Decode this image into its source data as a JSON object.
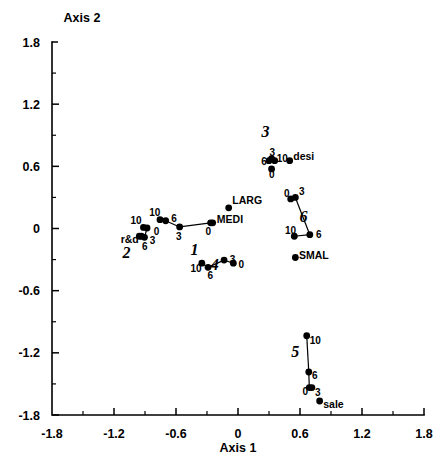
{
  "chart_data": {
    "type": "scatter",
    "title": "",
    "xlabel": "Axis 1",
    "ylabel": "Axis 2",
    "xlim": [
      -1.8,
      1.8
    ],
    "ylim": [
      -1.8,
      1.8
    ],
    "xticks": [
      "-1.8",
      "-1.2",
      "-0.6",
      "0",
      "0.6",
      "1.2",
      "1.8"
    ],
    "xtickvals": [
      -1.8,
      -1.2,
      -0.6,
      0,
      0.6,
      1.2,
      1.8
    ],
    "yticks": [
      "1.8",
      "1.2",
      "0.6",
      "0",
      "-0.6",
      "-1.2",
      "-1.8"
    ],
    "ytickvals": [
      1.8,
      1.2,
      0.6,
      0,
      -0.6,
      -1.2,
      -1.8
    ],
    "grid": false,
    "legend": "none",
    "series": [
      {
        "name": "1",
        "cluster_label": "1",
        "cluster_label_pos": [
          -0.42,
          -0.255
        ],
        "connected": true,
        "points": [
          {
            "label": "10",
            "x": -0.755,
            "y": 0.085,
            "lx": -0.86,
            "ly": 0.155
          },
          {
            "label": "6",
            "x": -0.7,
            "y": 0.075,
            "lx": -0.645,
            "ly": 0.1
          },
          {
            "label": "3",
            "x": -0.565,
            "y": 0.015,
            "lx": -0.6,
            "ly": -0.075
          },
          {
            "label": "0",
            "x": -0.265,
            "y": 0.055,
            "lx": -0.315,
            "ly": -0.03
          }
        ]
      },
      {
        "name": "2",
        "cluster_label": "2",
        "cluster_label_pos": [
          -1.08,
          -0.285
        ],
        "connected": true,
        "points": [
          {
            "label": "10",
            "x": -0.915,
            "y": 0.01,
            "lx": -1.04,
            "ly": 0.075
          },
          {
            "label": "0",
            "x": -0.88,
            "y": 0.005,
            "lx": -0.815,
            "ly": -0.025
          },
          {
            "label": "3",
            "x": -0.905,
            "y": -0.085,
            "lx": -0.855,
            "ly": -0.115
          },
          {
            "label": "6",
            "x": -0.935,
            "y": -0.075,
            "lx": -0.93,
            "ly": -0.175
          },
          {
            "label": "r&d",
            "x": -0.955,
            "y": -0.075,
            "lx": -1.135,
            "ly": -0.11,
            "is_var": true
          }
        ]
      },
      {
        "name": "3",
        "cluster_label": "3",
        "cluster_label_pos": [
          0.265,
          0.885
        ],
        "connected": true,
        "points": [
          {
            "label": "6",
            "x": 0.3,
            "y": 0.655,
            "lx": 0.225,
            "ly": 0.645
          },
          {
            "label": "3",
            "x": 0.325,
            "y": 0.675,
            "lx": 0.305,
            "ly": 0.735
          },
          {
            "label": "10",
            "x": 0.355,
            "y": 0.655,
            "lx": 0.375,
            "ly": 0.675
          },
          {
            "label": "0",
            "x": 0.325,
            "y": 0.575,
            "lx": 0.3,
            "ly": 0.525
          }
        ]
      },
      {
        "name": "4",
        "cluster_label": "4",
        "cluster_label_pos": [
          -0.225,
          -0.4
        ],
        "connected": true,
        "points": [
          {
            "label": "10",
            "x": -0.35,
            "y": -0.335,
            "lx": -0.46,
            "ly": -0.39
          },
          {
            "label": "6",
            "x": -0.29,
            "y": -0.375,
            "lx": -0.295,
            "ly": -0.455
          },
          {
            "label": "3",
            "x": -0.135,
            "y": -0.305,
            "lx": -0.08,
            "ly": -0.3
          },
          {
            "label": "0",
            "x": -0.045,
            "y": -0.335,
            "lx": 0.005,
            "ly": -0.345
          }
        ]
      },
      {
        "name": "5",
        "cluster_label": "5",
        "cluster_label_pos": [
          0.555,
          -1.245
        ],
        "connected": true,
        "points": [
          {
            "label": "10",
            "x": 0.665,
            "y": -1.035,
            "lx": 0.695,
            "ly": -1.085
          },
          {
            "label": "6",
            "x": 0.685,
            "y": -1.385,
            "lx": 0.715,
            "ly": -1.42
          },
          {
            "label": "0",
            "x": 0.69,
            "y": -1.535,
            "lx": 0.625,
            "ly": -1.575
          },
          {
            "label": "3",
            "x": 0.715,
            "y": -1.535,
            "lx": 0.745,
            "ly": -1.585
          },
          {
            "label": "sale",
            "x": 0.79,
            "y": -1.665,
            "lx": 0.825,
            "ly": -1.7,
            "is_var": true
          }
        ]
      },
      {
        "name": "6",
        "cluster_label": "6",
        "cluster_label_pos": [
          0.635,
          0.065
        ],
        "connected": true,
        "points": [
          {
            "label": "0",
            "x": 0.51,
            "y": 0.285,
            "lx": 0.445,
            "ly": 0.335
          },
          {
            "label": "3",
            "x": 0.555,
            "y": 0.3,
            "lx": 0.59,
            "ly": 0.355
          },
          {
            "label": "6",
            "x": 0.695,
            "y": -0.06,
            "lx": 0.755,
            "ly": -0.055
          },
          {
            "label": "10",
            "x": 0.545,
            "y": -0.075,
            "lx": 0.455,
            "ly": -0.02
          }
        ]
      }
    ],
    "standalone_points": [
      {
        "label": "LARG",
        "x": -0.09,
        "y": 0.2,
        "lx": -0.055,
        "ly": 0.27,
        "is_var": true
      },
      {
        "label": "MEDI",
        "x": -0.245,
        "y": 0.055,
        "lx": -0.205,
        "ly": 0.085,
        "is_var": true
      },
      {
        "label": "desi",
        "x": 0.5,
        "y": 0.655,
        "lx": 0.535,
        "ly": 0.695,
        "is_var": true
      },
      {
        "label": "SMAL",
        "x": 0.555,
        "y": -0.28,
        "lx": 0.59,
        "ly": -0.26,
        "is_var": true
      }
    ],
    "trajectory_links": [
      {
        "series": "1",
        "from": 0,
        "to": 1
      },
      {
        "series": "1",
        "from": 1,
        "to": 2
      },
      {
        "series": "1",
        "from": 2,
        "to": 3
      },
      {
        "series": "2",
        "from": 0,
        "to": 1
      },
      {
        "series": "2",
        "from": 1,
        "to": 2
      },
      {
        "series": "2",
        "from": 2,
        "to": 3
      },
      {
        "series": "4",
        "from": 0,
        "to": 1
      },
      {
        "series": "4",
        "from": 1,
        "to": 2
      },
      {
        "series": "4",
        "from": 2,
        "to": 3
      },
      {
        "series": "5",
        "from": 0,
        "to": 1
      },
      {
        "series": "5",
        "from": 1,
        "to": 2
      },
      {
        "series": "5",
        "from": 2,
        "to": 3
      },
      {
        "series": "6",
        "from": 0,
        "to": 1
      },
      {
        "series": "6",
        "from": 1,
        "to": 2
      },
      {
        "series": "6",
        "from": 2,
        "to": 3
      }
    ]
  },
  "colors": {
    "background": "#ffffff",
    "foreground": "#000000",
    "point": "#000000",
    "axis": "#000000"
  }
}
